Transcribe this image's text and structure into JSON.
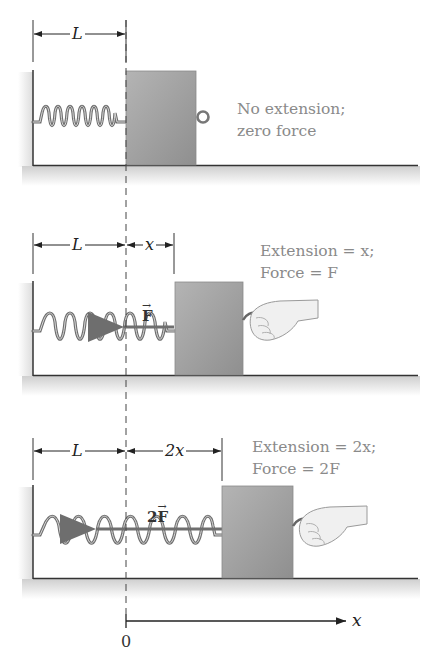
{
  "figure": {
    "colors": {
      "block": "#a3a3a3",
      "spring": "#7a7a7a",
      "line": "#333333",
      "label_text": "#8a8a8a",
      "shadow": "#e6e6e6"
    },
    "panels": [
      {
        "id": "no-extension",
        "dimensions": [
          {
            "label": "L"
          }
        ],
        "force_label": "",
        "caption_line1": "No extension;",
        "caption_line2": "zero force",
        "has_hand": false
      },
      {
        "id": "extension-x",
        "dimensions": [
          {
            "label": "L"
          },
          {
            "label": "x"
          }
        ],
        "force_label": "F",
        "caption_line1": "Extension = x;",
        "caption_line2": "Force = F",
        "has_hand": true
      },
      {
        "id": "extension-2x",
        "dimensions": [
          {
            "label": "L"
          },
          {
            "label": "2x"
          }
        ],
        "force_label_coeff": "2",
        "force_label": "F",
        "caption_line1": "Extension = 2x;",
        "caption_line2": "Force = 2F",
        "has_hand": true
      }
    ],
    "axis": {
      "origin_label": "0",
      "axis_label": "x"
    }
  }
}
